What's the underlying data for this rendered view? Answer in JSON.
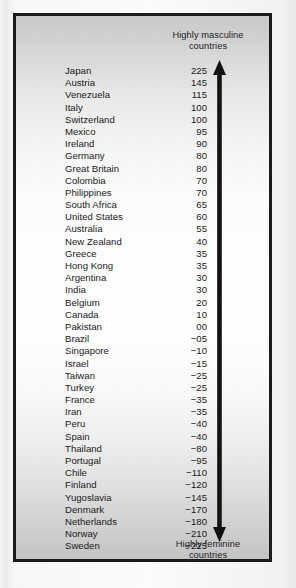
{
  "figure": {
    "top_caption": "Highly masculine countries",
    "top_caption_line1": "Highly masculine",
    "top_caption_line2": "countries",
    "bottom_caption": "Highly feminine countries",
    "bottom_caption_line1": "Highly feminine",
    "bottom_caption_line2": "countries",
    "arrow_name": "double-headed-vertical-arrow",
    "text_color": "#1a1a1a",
    "frame_color": "#1b1b1b",
    "panel_background": "#ffffff"
  },
  "chart_data": {
    "type": "table",
    "xlabel": "",
    "ylabel": "Masculinity index",
    "columns": [
      "Country",
      "Score"
    ],
    "annotations": [
      "Highly masculine countries",
      "Highly feminine countries"
    ],
    "axis_direction": "descending, masculine at top to feminine at bottom",
    "legend": "none",
    "grid": false,
    "categories": [
      "Japan",
      "Austria",
      "Venezuela",
      "Italy",
      "Switzerland",
      "Mexico",
      "Ireland",
      "Germany",
      "Great Britain",
      "Colombia",
      "Philippines",
      "South Africa",
      "United States",
      "Australia",
      "New Zealand",
      "Greece",
      "Hong Kong",
      "Argentina",
      "India",
      "Belgium",
      "Canada",
      "Pakistan",
      "Brazil",
      "Singapore",
      "Israel",
      "Taiwan",
      "Turkey",
      "France",
      "Iran",
      "Peru",
      "Spain",
      "Thailand",
      "Portugal",
      "Chile",
      "Finland",
      "Yugoslavia",
      "Denmark",
      "Netherlands",
      "Norway",
      "Sweden"
    ],
    "values": [
      225,
      145,
      115,
      100,
      100,
      95,
      90,
      80,
      80,
      70,
      70,
      65,
      60,
      55,
      40,
      35,
      35,
      30,
      30,
      20,
      10,
      0,
      -5,
      -10,
      -15,
      -25,
      -25,
      -35,
      -35,
      -40,
      -40,
      -80,
      -95,
      -110,
      -120,
      -145,
      -170,
      -180,
      -210,
      -225
    ],
    "ylim": [
      -225,
      225
    ],
    "rows": [
      {
        "country": "Japan",
        "score": "225"
      },
      {
        "country": "Austria",
        "score": "145"
      },
      {
        "country": "Venezuela",
        "score": "115"
      },
      {
        "country": "Italy",
        "score": "100"
      },
      {
        "country": "Switzerland",
        "score": "100"
      },
      {
        "country": "Mexico",
        "score": "95"
      },
      {
        "country": "Ireland",
        "score": "90"
      },
      {
        "country": "Germany",
        "score": "80"
      },
      {
        "country": "Great Britain",
        "score": "80"
      },
      {
        "country": "Colombia",
        "score": "70"
      },
      {
        "country": "Philippines",
        "score": "70"
      },
      {
        "country": "South Africa",
        "score": "65"
      },
      {
        "country": "United States",
        "score": "60"
      },
      {
        "country": "Australia",
        "score": "55"
      },
      {
        "country": "New Zealand",
        "score": "40"
      },
      {
        "country": "Greece",
        "score": "35"
      },
      {
        "country": "Hong Kong",
        "score": "35"
      },
      {
        "country": "Argentina",
        "score": "30"
      },
      {
        "country": "India",
        "score": "30"
      },
      {
        "country": "Belgium",
        "score": "20"
      },
      {
        "country": "Canada",
        "score": "10"
      },
      {
        "country": "Pakistan",
        "score": "00"
      },
      {
        "country": "Brazil",
        "score": "−05"
      },
      {
        "country": "Singapore",
        "score": "−10"
      },
      {
        "country": "Israel",
        "score": "−15"
      },
      {
        "country": "Taiwan",
        "score": "−25"
      },
      {
        "country": "Turkey",
        "score": "−25"
      },
      {
        "country": "France",
        "score": "−35"
      },
      {
        "country": "Iran",
        "score": "−35"
      },
      {
        "country": "Peru",
        "score": "−40"
      },
      {
        "country": "Spain",
        "score": "−40"
      },
      {
        "country": "Thailand",
        "score": "−80"
      },
      {
        "country": "Portugal",
        "score": "−95"
      },
      {
        "country": "Chile",
        "score": "−110"
      },
      {
        "country": "Finland",
        "score": "−120"
      },
      {
        "country": "Yugoslavia",
        "score": "−145"
      },
      {
        "country": "Denmark",
        "score": "−170"
      },
      {
        "country": "Netherlands",
        "score": "−180"
      },
      {
        "country": "Norway",
        "score": "−210"
      },
      {
        "country": "Sweden",
        "score": "−225"
      }
    ]
  }
}
